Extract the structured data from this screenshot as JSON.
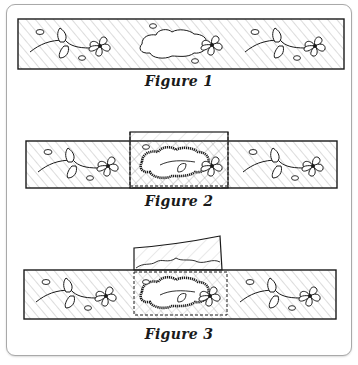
{
  "figures": [
    {
      "id": "figure-1",
      "caption": "Figure 1",
      "description": "Fabric strip with floral vine pattern and a torn hole in the center"
    },
    {
      "id": "figure-2",
      "caption": "Figure 2",
      "description": "Patch fabric placed behind the hole; dashed outline marks trimmed patch area; hole edges stitched"
    },
    {
      "id": "figure-3",
      "caption": "Figure 3",
      "description": "Patch fabric trimmed along a wavy line above strip; hole edges darned onto patch within dashed area"
    }
  ],
  "colors": {
    "ink": "#1a1a1a",
    "hatch": "#9a9a9a",
    "frame_border": "#a9a9a9",
    "background": "#ffffff"
  }
}
